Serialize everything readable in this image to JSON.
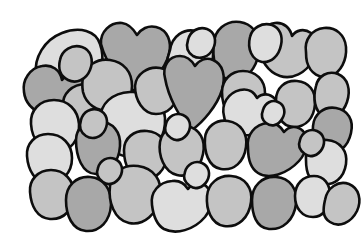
{
  "figure": {
    "background_color": "#ffffff",
    "outline_color": "#0d0d0d",
    "outline_width": 2.6,
    "canvas": {
      "width": 363,
      "height": 248
    },
    "mass_bounds": {
      "left": 22,
      "top": 20,
      "right": 348,
      "bottom": 233
    },
    "grain_count": 42
  },
  "palette": {
    "light": "#dedede",
    "medium": "#c4c4c4",
    "dark": "#a8a8a8",
    "outline": "#0d0d0d",
    "background": "#ffffff"
  },
  "grains": [
    {
      "id": "grain-01",
      "tone": "light",
      "label": "top-left light pebble",
      "path": "M 36 74 C 34 58, 44 40, 62 33 C 80 26, 96 31, 100 44 C 105 58, 102 76, 94 88 C 86 100, 68 104, 54 98 C 42 93, 38 84, 36 74 Z"
    },
    {
      "id": "grain-02",
      "tone": "dark",
      "label": "top heart-shaped dark pebble",
      "path": "M 101 44 C 100 32, 110 22, 122 23 C 130 24, 134 30, 137 35 C 141 29, 148 25, 156 27 C 168 30, 172 42, 169 54 C 165 70, 150 84, 136 92 C 122 84, 106 64, 101 44 Z"
    },
    {
      "id": "grain-03",
      "tone": "light",
      "label": "top light pebble right of heart",
      "path": "M 170 50 C 172 36, 184 28, 196 31 C 208 34, 214 44, 213 56 C 212 70, 205 82, 194 87 C 182 92, 170 86, 167 74 C 165 64, 168 56, 170 50 Z"
    },
    {
      "id": "grain-04",
      "tone": "dark",
      "label": "upper-center-right dark pebble",
      "path": "M 214 44 C 214 30, 226 20, 240 22 C 252 24, 258 33, 259 44 C 260 58, 254 72, 243 78 C 231 84, 218 78, 215 64 C 213 56, 213 50, 214 44 Z"
    },
    {
      "id": "grain-05",
      "tone": "medium",
      "label": "upper-right bulbous medium pebble",
      "path": "M 259 46 C 258 34, 265 24, 275 23 C 284 22, 290 28, 292 36 C 296 30, 304 28, 311 33 C 318 39, 318 50, 313 60 C 306 73, 292 80, 280 76 C 268 72, 260 60, 259 46 Z"
    },
    {
      "id": "grain-06",
      "tone": "light",
      "label": "top-right light pebble",
      "path": "M 250 37 C 252 28, 262 22, 272 25 C 280 28, 283 36, 281 45 C 279 56, 271 63, 262 62 C 252 60, 247 49, 250 37 Z"
    },
    {
      "id": "grain-07",
      "tone": "medium",
      "label": "far-top-right medium pebble",
      "path": "M 306 52 C 304 40, 312 29, 324 28 C 336 27, 345 35, 346 47 C 347 60, 341 72, 331 76 C 320 80, 310 73, 307 62 C 306 58, 306 55, 306 52 Z"
    },
    {
      "id": "grain-08",
      "tone": "dark",
      "label": "left-edge dark pebble",
      "path": "M 24 92 C 22 80, 30 68, 42 66 C 52 64, 60 70, 62 80 C 66 74, 74 72, 81 77 C 89 83, 89 95, 83 104 C 75 116, 58 120, 44 115 C 32 110, 25 102, 24 92 Z"
    },
    {
      "id": "grain-09",
      "tone": "medium",
      "label": "left-upper medium pebble",
      "path": "M 63 106 C 62 94, 72 84, 86 84 C 100 84, 110 92, 112 104 C 114 118, 106 130, 94 134 C 80 138, 68 130, 64 118 C 63 114, 63 110, 63 106 Z"
    },
    {
      "id": "grain-10",
      "tone": "medium",
      "label": "upper-center-left medium pebble",
      "path": "M 83 78 C 85 66, 97 58, 110 60 C 124 62, 132 72, 132 86 C 132 100, 124 110, 111 111 C 97 112, 86 104, 83 92 C 82 86, 82 82, 83 78 Z"
    },
    {
      "id": "grain-11",
      "tone": "light",
      "label": "left light pebble mid-upper",
      "path": "M 31 124 C 30 110, 40 100, 54 100 C 68 100, 78 110, 79 124 C 80 140, 70 152, 56 152 C 42 152, 32 140, 31 124 Z"
    },
    {
      "id": "grain-12",
      "tone": "light",
      "label": "large center light pebble",
      "path": "M 101 118 C 100 104, 112 93, 130 92 C 150 91, 164 101, 165 118 C 166 136, 156 152, 140 156 C 122 160, 106 150, 102 134 C 101 128, 101 123, 101 118 Z"
    },
    {
      "id": "grain-13",
      "tone": "medium",
      "label": "center-left medium pebble",
      "path": "M 135 86 C 136 74, 148 66, 160 68 C 172 70, 179 80, 178 92 C 177 105, 168 114, 156 114 C 143 114, 135 100, 135 86 Z"
    },
    {
      "id": "grain-14",
      "tone": "dark",
      "label": "central dark heart pebble",
      "path": "M 165 78 C 162 66, 169 56, 180 56 C 188 56, 192 61, 195 66 C 199 60, 206 57, 213 60 C 223 64, 226 76, 222 90 C 217 106, 203 122, 192 130 C 180 120, 168 96, 165 78 Z"
    },
    {
      "id": "grain-15",
      "tone": "medium",
      "label": "center-right medium pebble",
      "path": "M 222 92 C 222 80, 231 71, 243 71 C 256 71, 265 80, 265 93 C 265 108, 256 119, 243 120 C 230 121, 222 108, 222 92 Z"
    },
    {
      "id": "grain-16",
      "tone": "light",
      "label": "right light pebble upper-mid",
      "path": "M 224 116 C 221 104, 228 93, 240 90 C 248 88, 254 92, 257 98 C 262 93, 270 93, 275 99 C 281 107, 278 119, 270 126 C 258 136, 242 138, 232 132 C 226 128, 225 122, 224 116 Z"
    },
    {
      "id": "grain-17",
      "tone": "medium",
      "label": "right medium pebble",
      "path": "M 276 100 C 276 88, 285 80, 297 81 C 309 82, 316 91, 315 104 C 314 118, 306 127, 294 127 C 281 127, 276 114, 276 100 Z"
    },
    {
      "id": "grain-18",
      "tone": "medium",
      "label": "far-right medium pebble upper",
      "path": "M 316 86 C 318 76, 328 70, 338 74 C 348 78, 351 90, 347 102 C 343 114, 333 120, 324 116 C 314 112, 313 97, 316 86 Z"
    },
    {
      "id": "grain-19",
      "tone": "dark",
      "label": "far-right dark pebble",
      "path": "M 313 126 C 314 114, 324 106, 336 108 C 348 110, 354 120, 351 133 C 348 147, 338 155, 327 152 C 316 149, 312 138, 313 126 Z"
    },
    {
      "id": "grain-20",
      "tone": "light",
      "label": "left light pebble lower-mid",
      "path": "M 27 156 C 26 144, 35 134, 48 134 C 62 134, 72 144, 72 158 C 72 173, 62 183, 48 183 C 35 183, 28 170, 27 156 Z"
    },
    {
      "id": "grain-21",
      "tone": "dark",
      "label": "center-left dark pebble",
      "path": "M 76 140 C 76 128, 86 120, 99 121 C 113 122, 121 132, 120 146 C 119 162, 109 174, 96 174 C 82 174, 76 156, 76 140 Z"
    },
    {
      "id": "grain-22",
      "tone": "medium",
      "label": "center medium pebble",
      "path": "M 124 150 C 124 138, 134 130, 147 131 C 160 132, 168 142, 167 155 C 166 170, 156 180, 143 179 C 130 178, 124 165, 124 150 Z"
    },
    {
      "id": "grain-23",
      "tone": "medium",
      "label": "center-lower medium pebble",
      "path": "M 160 142 C 162 130, 174 123, 187 126 C 200 129, 206 140, 203 154 C 200 169, 189 178, 177 175 C 164 172, 158 155, 160 142 Z"
    },
    {
      "id": "grain-24",
      "tone": "medium",
      "label": "center-right lower medium pebble",
      "path": "M 205 138 C 206 127, 216 119, 228 121 C 241 123, 248 134, 246 147 C 244 162, 234 171, 221 169 C 208 167, 204 151, 205 138 Z"
    },
    {
      "id": "grain-25",
      "tone": "dark",
      "label": "right dark pebble lower-mid",
      "path": "M 248 148 C 246 135, 255 124, 268 123 C 276 122, 281 127, 284 132 C 289 126, 297 125, 303 131 C 310 139, 307 152, 299 161 C 287 174, 269 180, 258 173 C 250 168, 248 157, 248 148 Z"
    },
    {
      "id": "grain-26",
      "tone": "light",
      "label": "right light pebble lower",
      "path": "M 306 160 C 305 148, 314 139, 327 140 C 340 141, 348 151, 346 164 C 344 178, 334 186, 322 184 C 309 182, 306 173, 306 160 Z"
    },
    {
      "id": "grain-27",
      "tone": "medium",
      "label": "left medium pebble bottom",
      "path": "M 30 192 C 29 180, 38 170, 51 170 C 64 170, 74 180, 74 194 C 74 209, 64 220, 50 219 C 37 218, 31 206, 30 192 Z"
    },
    {
      "id": "grain-28",
      "tone": "dark",
      "label": "bottom-left dark pebble",
      "path": "M 66 200 C 66 186, 76 176, 90 177 C 104 178, 112 190, 111 205 C 110 221, 100 232, 86 231 C 72 230, 66 215, 66 200 Z"
    },
    {
      "id": "grain-29",
      "tone": "medium",
      "label": "bottom-center-left medium pebble",
      "path": "M 110 186 C 111 173, 123 164, 138 166 C 154 168, 163 181, 160 197 C 157 214, 144 226, 129 223 C 114 220, 108 201, 110 186 Z"
    },
    {
      "id": "grain-30",
      "tone": "light",
      "label": "bottom-center light pebble",
      "path": "M 152 205 C 150 192, 159 182, 172 181 C 180 180, 185 184, 188 189 C 192 183, 200 181, 206 186 C 214 193, 213 207, 205 217 C 194 230, 176 235, 164 229 C 155 224, 153 213, 152 205 Z"
    },
    {
      "id": "grain-31",
      "tone": "medium",
      "label": "bottom-center-right medium pebble",
      "path": "M 207 196 C 208 184, 218 175, 231 176 C 245 177, 253 188, 251 202 C 249 218, 238 228, 224 226 C 211 224, 206 209, 207 196 Z"
    },
    {
      "id": "grain-32",
      "tone": "dark",
      "label": "bottom-right dark pebble",
      "path": "M 252 200 C 252 186, 262 176, 276 177 C 290 178, 298 189, 296 204 C 294 220, 283 230, 269 229 C 256 228, 252 214, 252 200 Z"
    },
    {
      "id": "grain-33",
      "tone": "light",
      "label": "bottom-right light pebble",
      "path": "M 295 196 C 295 184, 303 176, 314 176 C 324 176, 330 184, 330 195 C 330 208, 323 217, 313 217 C 302 217, 295 208, 295 196 Z"
    },
    {
      "id": "grain-34",
      "tone": "medium",
      "label": "far-bottom-right medium pebble",
      "path": "M 325 200 C 327 188, 338 180, 349 184 C 359 188, 362 200, 357 211 C 351 223, 339 228, 330 222 C 322 217, 323 209, 325 200 Z"
    },
    {
      "id": "grain-35",
      "tone": "medium",
      "label": "upper-left boundary medium sliver",
      "path": "M 60 60 C 62 50, 72 44, 82 47 C 91 50, 94 60, 90 70 C 86 80, 76 84, 68 80 C 60 76, 58 68, 60 60 Z"
    },
    {
      "id": "grain-36",
      "tone": "light",
      "label": "top light sliver between grains",
      "path": "M 188 40 C 190 31, 199 26, 207 29 C 215 32, 217 41, 213 49 C 209 57, 200 60, 193 56 C 187 52, 186 46, 188 40 Z"
    },
    {
      "id": "grain-37",
      "tone": "medium",
      "label": "mid-left medium sliver",
      "path": "M 81 120 C 83 112, 91 107, 99 110 C 107 113, 109 122, 105 130 C 101 138, 92 140, 86 136 C 80 132, 79 126, 81 120 Z"
    },
    {
      "id": "grain-38",
      "tone": "light",
      "label": "center small light sliver",
      "path": "M 166 124 C 168 116, 176 112, 183 115 C 190 118, 192 126, 188 133 C 184 140, 176 142, 171 138 C 165 134, 164 130, 166 124 Z"
    },
    {
      "id": "grain-39",
      "tone": "light",
      "label": "right small light sliver",
      "path": "M 263 110 C 265 103, 272 99, 278 102 C 285 105, 286 113, 282 119 C 278 126, 271 127, 266 123 C 261 119, 261 115, 263 110 Z"
    },
    {
      "id": "grain-40",
      "tone": "medium",
      "label": "lower-left medium sliver",
      "path": "M 98 168 C 100 160, 108 156, 115 159 C 122 162, 124 170, 120 177 C 116 184, 108 186, 103 182 C 97 178, 96 173, 98 168 Z"
    },
    {
      "id": "grain-41",
      "tone": "light",
      "label": "lower-center light sliver",
      "path": "M 185 172 C 187 164, 195 160, 202 163 C 209 166, 211 174, 207 181 C 203 188, 195 190, 190 186 C 184 182, 183 177, 185 172 Z"
    },
    {
      "id": "grain-42",
      "tone": "medium",
      "label": "right edge medium sliver",
      "path": "M 300 140 C 302 132, 310 128, 317 131 C 324 134, 326 142, 322 149 C 318 156, 310 158, 305 154 C 299 150, 298 145, 300 140 Z"
    }
  ]
}
